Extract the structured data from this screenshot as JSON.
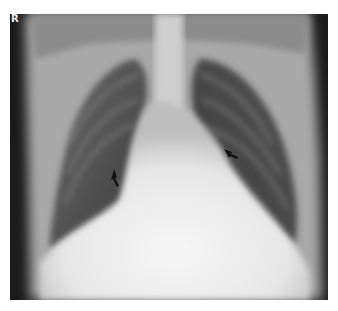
{
  "image": {
    "kind": "chest-radiograph-frontal",
    "marker_text": "R",
    "annotations": [
      {
        "type": "arrow",
        "label": "right-hilum-arrow",
        "x": 116,
        "y": 177
      },
      {
        "type": "arrow",
        "label": "left-hilum-arrow",
        "x": 232,
        "y": 155
      }
    ],
    "colors": {
      "frame": "#1a1a1a",
      "soft_tissue": "#e8e8e8",
      "lung": "#3a3a3a",
      "background": "#ffffff"
    }
  }
}
